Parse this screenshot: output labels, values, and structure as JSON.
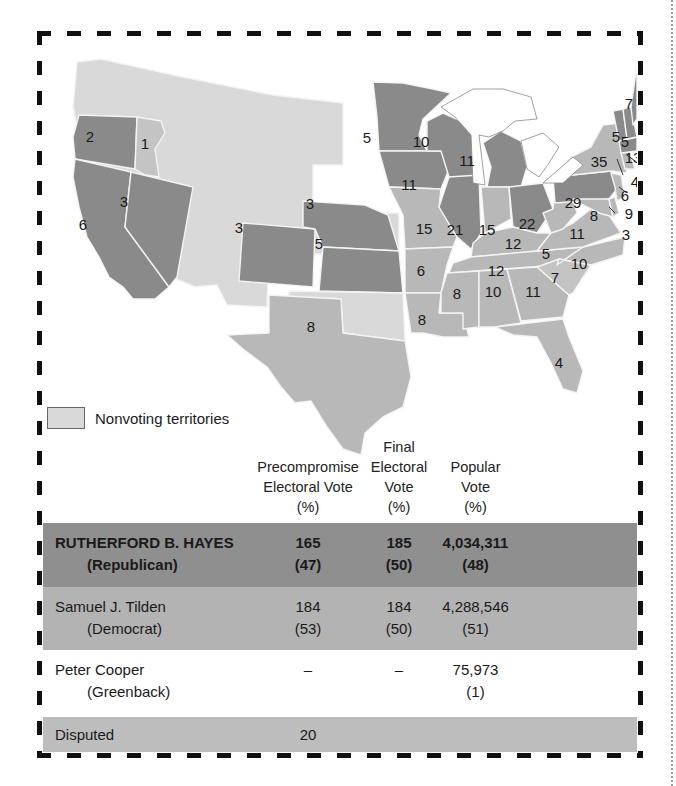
{
  "legend": {
    "label": "Nonvoting territories",
    "swatch_color": "#d9d9d9"
  },
  "colors": {
    "republican_state": "#8a8a8a",
    "democratic_state": "#b8b8b8",
    "nonvoting_territory": "#d9d9d9",
    "hayes_row": "#8f8f8f",
    "tilden_row": "#b3b3b3",
    "disputed_row": "#bdbdbd"
  },
  "map": {
    "states": [
      {
        "name": "OR",
        "votes": "2",
        "party": "rep"
      },
      {
        "name": "CA",
        "votes": "6",
        "party": "rep"
      },
      {
        "name": "NV",
        "votes": "3",
        "party": "rep"
      },
      {
        "name": "ID-east-OR",
        "votes": "1",
        "party": "dem"
      },
      {
        "name": "CO",
        "votes": "3",
        "party": "rep"
      },
      {
        "name": "NE",
        "votes": "3",
        "party": "rep"
      },
      {
        "name": "KS",
        "votes": "5",
        "party": "rep"
      },
      {
        "name": "TX",
        "votes": "8",
        "party": "dem"
      },
      {
        "name": "MN",
        "votes": "5",
        "party": "rep"
      },
      {
        "name": "IA",
        "votes": "11",
        "party": "rep"
      },
      {
        "name": "MO",
        "votes": "15",
        "party": "dem"
      },
      {
        "name": "AR",
        "votes": "6",
        "party": "dem"
      },
      {
        "name": "LA",
        "votes": "8",
        "party": "dem"
      },
      {
        "name": "WI",
        "votes": "10",
        "party": "rep"
      },
      {
        "name": "IL",
        "votes": "21",
        "party": "rep"
      },
      {
        "name": "MI",
        "votes": "11",
        "party": "rep"
      },
      {
        "name": "IN",
        "votes": "15",
        "party": "dem"
      },
      {
        "name": "OH",
        "votes": "22",
        "party": "rep"
      },
      {
        "name": "KY",
        "votes": "12",
        "party": "dem"
      },
      {
        "name": "TN",
        "votes": "12",
        "party": "dem"
      },
      {
        "name": "MS",
        "votes": "8",
        "party": "dem"
      },
      {
        "name": "AL",
        "votes": "10",
        "party": "dem"
      },
      {
        "name": "GA",
        "votes": "11",
        "party": "dem"
      },
      {
        "name": "FL",
        "votes": "4",
        "party": "dem"
      },
      {
        "name": "SC",
        "votes": "7",
        "party": "dem"
      },
      {
        "name": "NC",
        "votes": "10",
        "party": "dem"
      },
      {
        "name": "VA",
        "votes": "11",
        "party": "dem"
      },
      {
        "name": "WV",
        "votes": "5",
        "party": "dem"
      },
      {
        "name": "PA",
        "votes": "29",
        "party": "rep"
      },
      {
        "name": "MD",
        "votes": "8",
        "party": "dem"
      },
      {
        "name": "DE",
        "votes": "3",
        "party": "dem"
      },
      {
        "name": "NJ",
        "votes": "9",
        "party": "dem"
      },
      {
        "name": "NY",
        "votes": "35",
        "party": "dem"
      },
      {
        "name": "CT",
        "votes": "6",
        "party": "dem"
      },
      {
        "name": "RI",
        "votes": "4",
        "party": "rep"
      },
      {
        "name": "MA",
        "votes": "13",
        "party": "rep"
      },
      {
        "name": "VT",
        "votes": "5",
        "party": "rep"
      },
      {
        "name": "NH",
        "votes": "5",
        "party": "rep"
      },
      {
        "name": "ME",
        "votes": "7",
        "party": "rep"
      }
    ]
  },
  "table": {
    "headers": {
      "precompromise": [
        "Precompromise",
        "Electoral Vote",
        "(%)"
      ],
      "final": [
        "Final",
        "Electoral",
        "Vote",
        "(%)"
      ],
      "popular": [
        "Popular",
        "Vote",
        "(%)"
      ]
    },
    "rows": [
      {
        "name": "RUTHERFORD B. HAYES",
        "party": "(Republican)",
        "pre_votes": "165",
        "pre_pct": "(47)",
        "final_votes": "185",
        "final_pct": "(50)",
        "popular": "4,034,311",
        "popular_pct": "(48)"
      },
      {
        "name": "Samuel J. Tilden",
        "party": "(Democrat)",
        "pre_votes": "184",
        "pre_pct": "(53)",
        "final_votes": "184",
        "final_pct": "(50)",
        "popular": "4,288,546",
        "popular_pct": "(51)"
      },
      {
        "name": "Peter Cooper",
        "party": "(Greenback)",
        "pre_votes": "–",
        "pre_pct": "",
        "final_votes": "–",
        "final_pct": "",
        "popular": "75,973",
        "popular_pct": "(1)"
      },
      {
        "name": "Disputed",
        "party": "",
        "pre_votes": "20",
        "pre_pct": "",
        "final_votes": "",
        "final_pct": "",
        "popular": "",
        "popular_pct": ""
      }
    ]
  }
}
